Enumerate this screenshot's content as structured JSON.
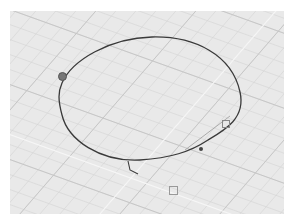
{
  "viewport": {
    "label": "Perspective",
    "background": "#e9e9e9",
    "grid_minor_color": "#d2d2d2",
    "grid_major_color": "#c2c2c2",
    "axis_color": "#f7f7f7",
    "curve_color": "#3a3a3a"
  },
  "curve": {
    "type": "closed-rounded-curve",
    "control_points": [
      {
        "name": "point-left",
        "x": 61,
        "y": 76
      },
      {
        "name": "point-right",
        "x": 217,
        "y": 114
      },
      {
        "name": "point-bottom-right",
        "x": 190,
        "y": 137
      },
      {
        "name": "point-bottom",
        "x": 160,
        "y": 178
      }
    ]
  }
}
